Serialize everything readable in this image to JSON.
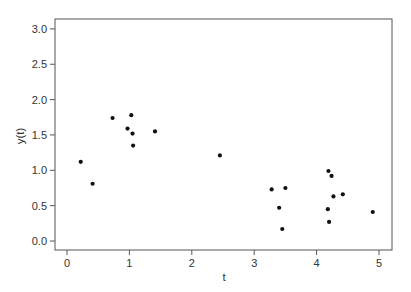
{
  "chart_data": {
    "type": "scatter",
    "title": "",
    "xlabel": "t",
    "ylabel": "y(t)",
    "xlim": [
      -0.2,
      5.2
    ],
    "ylim": [
      -0.13,
      3.12
    ],
    "x_ticks": [
      0,
      1,
      2,
      3,
      4,
      5
    ],
    "x_tick_labels": [
      "0",
      "1",
      "2",
      "3",
      "4",
      "5"
    ],
    "y_ticks": [
      0.0,
      0.5,
      1.0,
      1.5,
      2.0,
      2.5,
      3.0
    ],
    "y_tick_labels": [
      "0.0",
      "0.5",
      "1.0",
      "1.5",
      "2.0",
      "2.5",
      "3.0"
    ],
    "grid": false,
    "legend": null,
    "marker_color": "#111111",
    "points": [
      {
        "x": 0.22,
        "y": 1.12
      },
      {
        "x": 0.41,
        "y": 0.81
      },
      {
        "x": 0.73,
        "y": 1.74
      },
      {
        "x": 0.97,
        "y": 1.59
      },
      {
        "x": 1.03,
        "y": 1.78
      },
      {
        "x": 1.05,
        "y": 1.52
      },
      {
        "x": 1.06,
        "y": 1.35
      },
      {
        "x": 1.41,
        "y": 1.55
      },
      {
        "x": 2.45,
        "y": 1.21
      },
      {
        "x": 3.28,
        "y": 0.73
      },
      {
        "x": 3.4,
        "y": 0.47
      },
      {
        "x": 3.45,
        "y": 0.17
      },
      {
        "x": 3.5,
        "y": 0.75
      },
      {
        "x": 4.18,
        "y": 0.45
      },
      {
        "x": 4.19,
        "y": 0.99
      },
      {
        "x": 4.2,
        "y": 0.27
      },
      {
        "x": 4.24,
        "y": 0.92
      },
      {
        "x": 4.27,
        "y": 0.63
      },
      {
        "x": 4.42,
        "y": 0.66
      },
      {
        "x": 4.9,
        "y": 0.41
      }
    ]
  },
  "layout": {
    "plot_box": {
      "left": 55,
      "top": 19,
      "right": 392,
      "bottom": 250
    },
    "x_pixel": {
      "origin": 67,
      "per_unit": 62.4
    },
    "y_pixel": {
      "origin": 241,
      "per_unit": 70.7
    }
  }
}
